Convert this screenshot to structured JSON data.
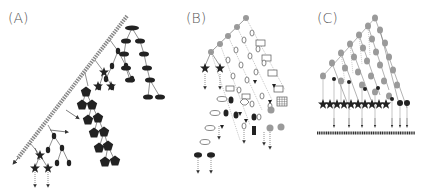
{
  "figure": {
    "panels": [
      {
        "id": "A",
        "label": "(A)",
        "description": "Long chain of small grey beads forming diagonal backbone with branching trees of ellipses, stars, pentagons and small ovals; arrows exit downward"
      },
      {
        "id": "B",
        "label": "(B)",
        "description": "Grey-node backbone with hanging chains of open shapes (rectangles, ovals, diamonds), black ovals, stars, grid square and grey circles; dotted arrows downward"
      },
      {
        "id": "C",
        "label": "(C)",
        "description": "Binary-like triangular lattice of grey ovals with black dots; row of stars and arrows descending to horizontal bead line at bottom"
      }
    ],
    "colors": {
      "ink": "#222222",
      "grey_node": "#9a9a9a",
      "bead": "#8c8c8c",
      "line": "#444444",
      "label": "#555555",
      "background": "#ffffff"
    }
  }
}
